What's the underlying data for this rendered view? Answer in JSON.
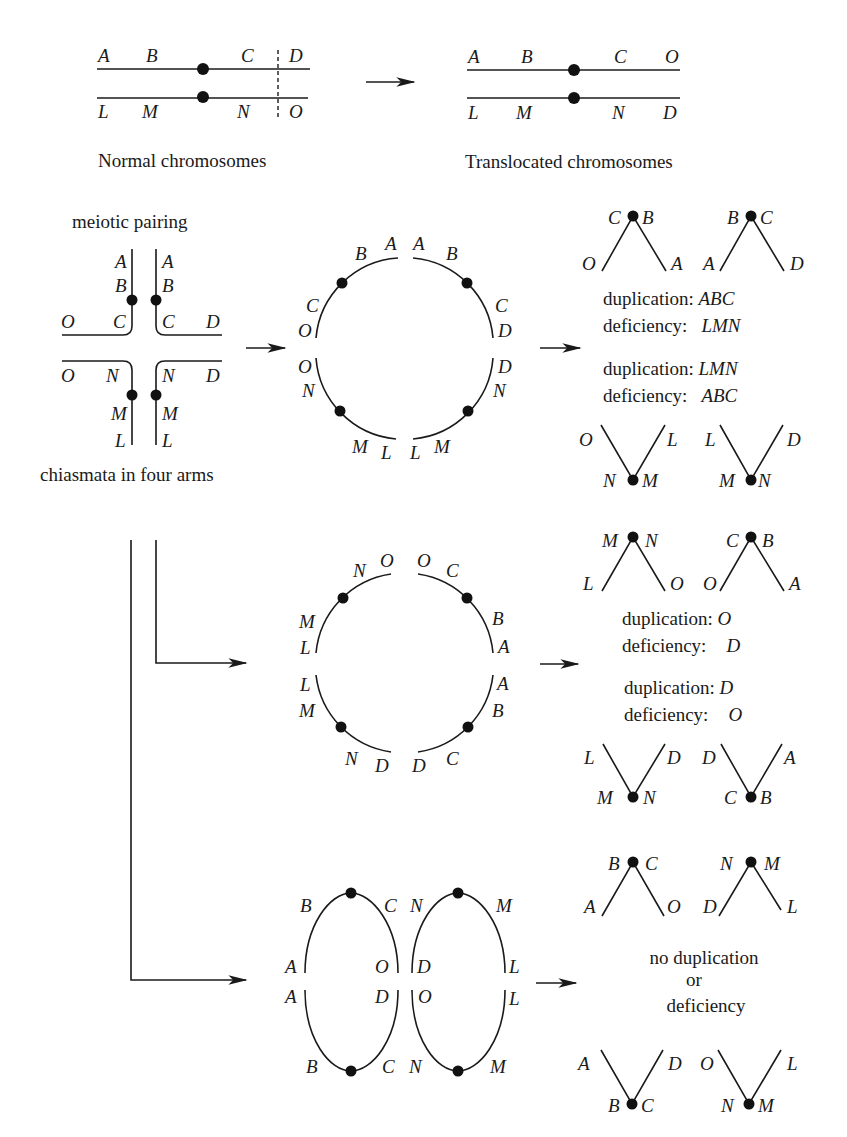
{
  "top": {
    "normal": {
      "caption": "Normal chromosomes",
      "upper_labels": [
        "A",
        "B",
        "C",
        "D"
      ],
      "lower_labels": [
        "L",
        "M",
        "N",
        "O"
      ]
    },
    "translocated": {
      "caption": "Translocated chromosomes",
      "upper_labels": [
        "A",
        "B",
        "C",
        "O"
      ],
      "lower_labels": [
        "L",
        "M",
        "N",
        "D"
      ]
    }
  },
  "pairing": {
    "title": "meiotic pairing",
    "caption": "chiasmata in four arms",
    "labels": {
      "ul_vert": [
        "A",
        "B"
      ],
      "ur_vert": [
        "A",
        "B"
      ],
      "ul_horiz": [
        "O",
        "C"
      ],
      "ur_horiz": [
        "C",
        "D"
      ],
      "ll_horiz": [
        "O",
        "N"
      ],
      "lr_horiz": [
        "N",
        "D"
      ],
      "ll_vert": [
        "M",
        "L"
      ],
      "lr_vert": [
        "M",
        "L"
      ]
    }
  },
  "ring1": {
    "labels": {
      "top_left": [
        "B",
        "A"
      ],
      "top_right": [
        "A",
        "B"
      ],
      "left_upper": [
        "C",
        "O"
      ],
      "right_upper": [
        "C",
        "D"
      ],
      "left_lower": [
        "O",
        "N"
      ],
      "right_lower": [
        "D",
        "N"
      ],
      "bottom_left": [
        "M",
        "L"
      ],
      "bottom_right": [
        "L",
        "M"
      ]
    },
    "result": {
      "top_pair": [
        {
          "left_dot": "C",
          "right_dot": "B",
          "left_end": "O",
          "right_end": "A"
        },
        {
          "left_dot": "B",
          "right_dot": "C",
          "left_end": "A",
          "right_end": "D"
        }
      ],
      "dup1": "duplication: ",
      "dup1_val": "ABC",
      "def1": "deficiency:",
      "def1_val": "LMN",
      "dup2": "duplication: ",
      "dup2_val": "LMN",
      "def2": "deficiency:",
      "def2_val": "ABC",
      "bottom_pair": [
        {
          "left_end": "O",
          "right_end": "L",
          "left_dot": "N",
          "right_dot": "M"
        },
        {
          "left_end": "L",
          "right_end": "D",
          "left_dot": "M",
          "right_dot": "N"
        }
      ]
    }
  },
  "ring2": {
    "labels": {
      "top_left": [
        "N",
        "O"
      ],
      "top_right": [
        "O",
        "C"
      ],
      "left_upper": [
        "M",
        "L"
      ],
      "right_upper": [
        "B",
        "A"
      ],
      "left_lower": [
        "L",
        "M"
      ],
      "right_lower": [
        "A",
        "B"
      ],
      "bottom_left": [
        "N",
        "D"
      ],
      "bottom_right": [
        "D",
        "C"
      ]
    },
    "result": {
      "top_pair": [
        {
          "left_dot": "M",
          "right_dot": "N",
          "left_end": "L",
          "right_end": "O"
        },
        {
          "left_dot": "C",
          "right_dot": "B",
          "left_end": "O",
          "right_end": "A"
        }
      ],
      "dup1": "duplication: ",
      "dup1_val": "O",
      "def1": "deficiency:",
      "def1_val": "D",
      "dup2": "duplication: ",
      "dup2_val": "D",
      "def2": "deficiency:",
      "def2_val": "O",
      "bottom_pair": [
        {
          "left_end": "L",
          "right_end": "D",
          "left_dot": "M",
          "right_dot": "N"
        },
        {
          "left_end": "D",
          "right_end": "A",
          "left_dot": "C",
          "right_dot": "B"
        }
      ]
    }
  },
  "ring3": {
    "labels": {
      "l_top": [
        "B",
        "C"
      ],
      "l_mid_up": [
        "A",
        "O"
      ],
      "l_mid_down": [
        "A",
        "D"
      ],
      "l_bottom": [
        "B",
        "C"
      ],
      "r_top": [
        "N",
        "M"
      ],
      "r_mid_up": [
        "D",
        "L"
      ],
      "r_mid_down": [
        "O",
        "L"
      ],
      "r_bottom": [
        "N",
        "M"
      ]
    },
    "result": {
      "top_pair": [
        {
          "left_dot": "B",
          "right_dot": "C",
          "left_end": "A",
          "right_end": "O"
        },
        {
          "left_dot": "N",
          "right_dot": "M",
          "left_end": "D",
          "right_end": "L"
        }
      ],
      "line1": "no duplication",
      "line2": "or",
      "line3": "deficiency",
      "bottom_pair": [
        {
          "left_end": "A",
          "right_end": "D",
          "left_dot": "B",
          "right_dot": "C"
        },
        {
          "left_end": "O",
          "right_end": "L",
          "left_dot": "N",
          "right_dot": "M"
        }
      ]
    }
  }
}
